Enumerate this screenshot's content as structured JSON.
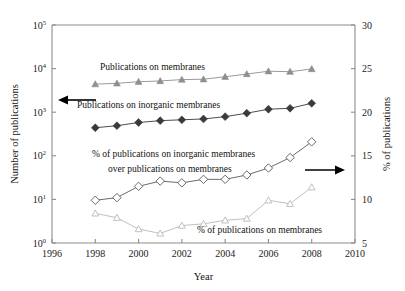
{
  "chart_data": {
    "type": "line",
    "title": "",
    "xlabel": "Year",
    "ylabel": "Number of publications",
    "ylabel_right": "% of publications",
    "xlim": [
      1996,
      2010
    ],
    "xticks": [
      1996,
      1998,
      2000,
      2002,
      2004,
      2006,
      2008,
      2010
    ],
    "ylim": [
      1,
      100000
    ],
    "yscale": "log",
    "yticks": [
      1,
      10,
      100,
      1000,
      10000,
      100000
    ],
    "ytick_labels": [
      "10^0",
      "10^1",
      "10^2",
      "10^3",
      "10^4",
      "10^5"
    ],
    "ylim_right": [
      5,
      30
    ],
    "yticks_right": [
      5,
      10,
      15,
      20,
      25,
      30
    ],
    "grid": false,
    "legend_position": "inline-annotations",
    "x": [
      1998,
      1999,
      2000,
      2001,
      2002,
      2003,
      2004,
      2005,
      2006,
      2007,
      2008
    ],
    "series": [
      {
        "name": "Publications on membranes",
        "axis": "left",
        "marker": "filled-triangle",
        "color": "#8f8f8f",
        "values": [
          4400,
          4600,
          5000,
          5200,
          5600,
          5700,
          6500,
          7500,
          8700,
          8500,
          9800
        ]
      },
      {
        "name": "Publications on inorganic membranes",
        "axis": "left",
        "marker": "filled-diamond",
        "color": "#3a3a3a",
        "values": [
          440,
          490,
          580,
          640,
          670,
          700,
          790,
          950,
          1170,
          1230,
          1600
        ]
      },
      {
        "name": "% of publications on inorganic membranes over publications on membranes",
        "axis": "right",
        "marker": "open-diamond",
        "color": "#5a5a5a",
        "values": [
          9.9,
          10.2,
          11.5,
          12.1,
          11.9,
          12.3,
          12.3,
          12.8,
          13.6,
          14.8,
          16.6
        ]
      },
      {
        "name": "% of publications on membranes",
        "axis": "right",
        "marker": "open-triangle",
        "color": "#b9b9b9",
        "values": [
          8.4,
          7.9,
          6.6,
          6.1,
          7.0,
          7.2,
          7.6,
          7.8,
          9.9,
          9.5,
          11.4
        ]
      }
    ],
    "annotations": [
      {
        "text": "Publications on membranes",
        "x_px": 100,
        "y_px": 70
      },
      {
        "text": "Publications on inorganic membranes",
        "x_px": 77,
        "y_px": 108
      },
      {
        "text": "% of publications on inorganic membranes",
        "x_px": 92,
        "y_px": 157
      },
      {
        "text": "over publications on membranes",
        "x_px": 108,
        "y_px": 172
      },
      {
        "text": "% of publications on membranes",
        "x_px": 197,
        "y_px": 233
      }
    ],
    "axis_pointers": [
      {
        "name": "left-axis-arrow",
        "direction": "left"
      },
      {
        "name": "right-axis-arrow",
        "direction": "right"
      }
    ]
  }
}
